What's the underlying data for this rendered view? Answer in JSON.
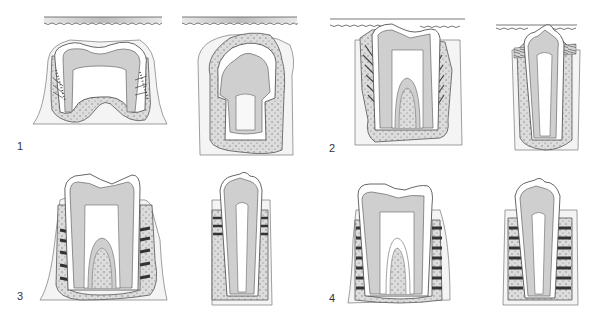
{
  "figure": {
    "type": "dental-histology-illustration",
    "panels": [
      {
        "label": "1",
        "description": "Developing molar and incisor in crypt, crown formation, covered by oral mucosa"
      },
      {
        "label": "2",
        "description": "Erupting molar and incisor with periodontal fibers forming, crown breaking through mucosa"
      },
      {
        "label": "3",
        "description": "Tooth in occlusion with periodontal ligament fiber bundles, molar and incisor"
      },
      {
        "label": "4",
        "description": "Mature tooth with fully organized periodontal ligament, molar and incisor"
      }
    ]
  },
  "colors": {
    "dentin": "#cfcfcf",
    "enamel": "#ffffff",
    "pulp": "#f4f4f4",
    "bone": "#dcdcdc",
    "soft_tissue": "#f2f2f2",
    "outline": "#555555",
    "mucosa_band": "#c8c8c8"
  }
}
